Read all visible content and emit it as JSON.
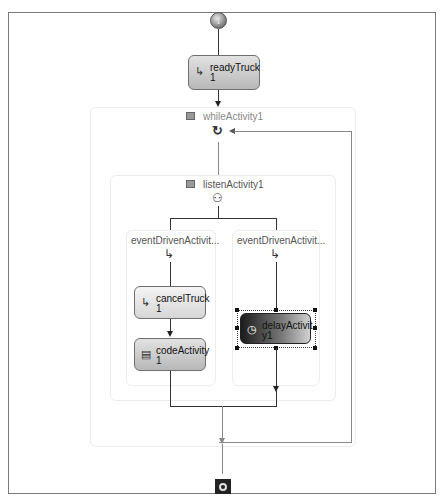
{
  "workflow": {
    "start": {
      "icon": "workflow-start-icon"
    },
    "end": {
      "icon": "workflow-end-icon"
    },
    "readyTruck": {
      "line1": "readyTruck",
      "line2": "1",
      "icon": "event-sink-icon"
    },
    "whileActivity": {
      "label": "whileActivity1",
      "icon": "loop-icon",
      "collapse": "collapse-toggle"
    },
    "listenActivity": {
      "label": "listenActivity1",
      "icon": "listen-icon",
      "collapse": "collapse-toggle"
    },
    "branches": [
      {
        "label": "eventDrivenActivit...",
        "icon": "event-driven-icon",
        "activities": [
          {
            "line1": "cancelTruck",
            "line2": "1",
            "icon": "event-sink-icon"
          },
          {
            "line1": "codeActivity",
            "line2": "1",
            "icon": "code-icon"
          }
        ]
      },
      {
        "label": "eventDrivenActivit...",
        "icon": "event-driven-icon",
        "activities": [
          {
            "line1": "delayActivit",
            "line2": "y1",
            "icon": "delay-icon",
            "selected": true
          }
        ]
      }
    ]
  },
  "colors": {
    "border": "#7a7a7a",
    "connector": "#333333",
    "loopback": "#888888",
    "selected_dark": "#1c1c1c"
  }
}
